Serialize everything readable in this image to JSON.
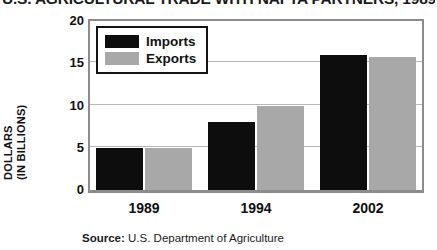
{
  "chart_data": {
    "type": "bar",
    "title": "U.S. AGRICULTURAL TRADE WITH NAFTA PARTNERS, 1989",
    "xlabel": "",
    "ylabel": "DOLLARS (IN BILLIONS)",
    "ylabel_line1": "DOLLARS",
    "ylabel_line2": "(IN BILLIONS)",
    "categories": [
      "1989",
      "1994",
      "2002"
    ],
    "series": [
      {
        "name": "Imports",
        "color": "#0d0d0d",
        "values": [
          5.0,
          8.0,
          16.0
        ]
      },
      {
        "name": "Exports",
        "color": "#a8a8a8",
        "values": [
          5.0,
          10.0,
          15.8
        ]
      }
    ],
    "ylim": [
      0,
      20
    ],
    "yticks": [
      20,
      15,
      10,
      5,
      0
    ],
    "grid": true,
    "legend_position": "top-left",
    "legend_entries": [
      "Imports",
      "Exports"
    ]
  },
  "source": {
    "label": "Source:",
    "text": "U.S. Department of Agriculture"
  },
  "colors": {
    "imports": "#0d0d0d",
    "exports": "#a8a8a8",
    "frame": "#8c8c8c",
    "gridline": "#b8b8b8",
    "text": "#111111"
  }
}
